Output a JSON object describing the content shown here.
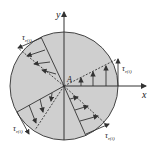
{
  "diagram": {
    "axes": {
      "x_label": "x",
      "y_label": "y"
    },
    "point_label": "A",
    "stress_label": "τ",
    "stress_sub": "r(i)",
    "colors": {
      "section_fill": "#cfcfcf",
      "line": "#333333",
      "background": "#ffffff"
    },
    "center": [
      64,
      86
    ],
    "radius": 54,
    "radial_lines_deg": [
      30,
      115,
      210,
      300
    ],
    "stress_labels": [
      {
        "position": "upper-left",
        "text": "τr(i)"
      },
      {
        "position": "right",
        "text": "τr(i)"
      },
      {
        "position": "lower-left",
        "text": "τr(i)"
      },
      {
        "position": "lower-right",
        "text": "τr(i)"
      }
    ]
  }
}
